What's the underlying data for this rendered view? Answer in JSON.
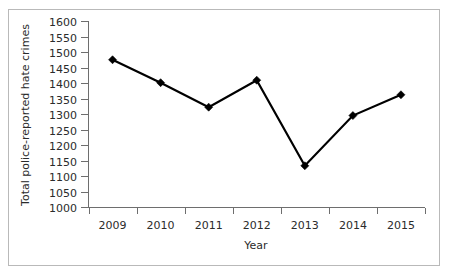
{
  "chart_data": {
    "type": "line",
    "title": "",
    "xlabel": "Year",
    "ylabel": "Total police-reported hate crimes",
    "categories": [
      "2009",
      "2010",
      "2011",
      "2012",
      "2013",
      "2014",
      "2015"
    ],
    "x": [
      2009,
      2010,
      2011,
      2012,
      2013,
      2014,
      2015
    ],
    "values": [
      1475,
      1401,
      1322,
      1409,
      1133,
      1295,
      1362
    ],
    "series": [
      {
        "name": "Total police-reported hate crimes",
        "values": [
          1475,
          1401,
          1322,
          1409,
          1133,
          1295,
          1362
        ]
      }
    ],
    "ylim": [
      1000,
      1600
    ],
    "ytick_step": 50,
    "yticks": [
      1000,
      1050,
      1100,
      1150,
      1200,
      1250,
      1300,
      1350,
      1400,
      1450,
      1500,
      1550,
      1600
    ],
    "ytick_labels": [
      "1000",
      "1050",
      "1100",
      "1150",
      "1200",
      "1250",
      "1300",
      "1350",
      "1400",
      "1450",
      "1500",
      "1550",
      "1600"
    ],
    "xtick_labels": [
      "2009",
      "2010",
      "2011",
      "2012",
      "2013",
      "2014",
      "2015"
    ],
    "grid": false,
    "legend": false,
    "legend_position": "none",
    "marker": "diamond",
    "line_color": "#000000",
    "marker_color": "#000000",
    "axis_color": "#6e6e6e",
    "text_color": "#2b2b2b",
    "frame_color": "#b9b9b9",
    "background": "#ffffff"
  }
}
